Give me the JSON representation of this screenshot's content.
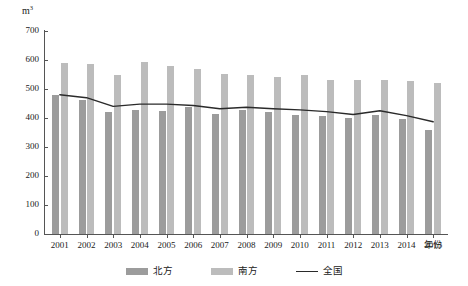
{
  "chart_data": {
    "type": "bar",
    "title": "",
    "subtitle": "",
    "unit_label": "m",
    "unit_superscript": "3",
    "xlabel": "年份",
    "ylabel": "",
    "ylim": [
      0,
      700
    ],
    "ytick_step": 100,
    "yticks": [
      0,
      100,
      200,
      300,
      400,
      500,
      600,
      700
    ],
    "grid": false,
    "legend_position": "bottom-center",
    "categories": [
      "2001",
      "2002",
      "2003",
      "2004",
      "2005",
      "2006",
      "2007",
      "2008",
      "2009",
      "2010",
      "2011",
      "2012",
      "2013",
      "2014",
      "2015"
    ],
    "series": [
      {
        "name": "北方",
        "type": "bar",
        "color": "#9c9c9c",
        "values": [
          478,
          462,
          422,
          428,
          425,
          438,
          415,
          428,
          420,
          412,
          408,
          400,
          412,
          398,
          360
        ]
      },
      {
        "name": "南方",
        "type": "bar",
        "color": "#bcbcbc",
        "values": [
          590,
          585,
          547,
          592,
          578,
          568,
          552,
          548,
          542,
          548,
          532,
          530,
          532,
          528,
          520
        ]
      },
      {
        "name": "全国",
        "type": "line",
        "color": "#2a2a2a",
        "values": [
          480,
          470,
          440,
          448,
          448,
          443,
          432,
          437,
          432,
          428,
          422,
          412,
          425,
          408,
          387
        ]
      }
    ]
  },
  "legend": {
    "items": [
      {
        "label": "北方",
        "marker": "swatch",
        "color": "#9c9c9c"
      },
      {
        "label": "南方",
        "marker": "swatch",
        "color": "#bcbcbc"
      },
      {
        "label": "全国",
        "marker": "line",
        "color": "#2a2a2a"
      }
    ]
  }
}
